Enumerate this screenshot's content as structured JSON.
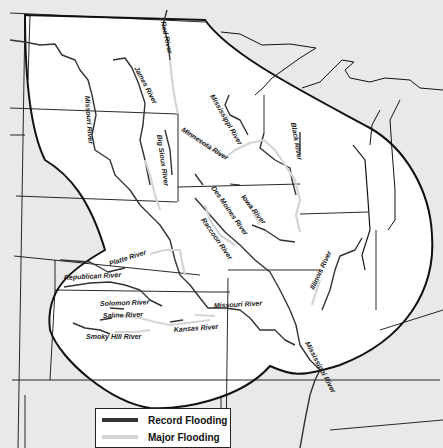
{
  "map": {
    "colors": {
      "outside_region": "#e9e9e9",
      "flood_region": "#ffffff",
      "border": "#111111",
      "record_flooding": "#333333",
      "major_flooding": "#d4d4d4"
    },
    "river_labels": [
      {
        "name": "Red River",
        "x": 161,
        "y": 22,
        "rotate": 78
      },
      {
        "name": "James River",
        "x": 134,
        "y": 68,
        "rotate": 62
      },
      {
        "name": "Missouri River",
        "x": 85,
        "y": 96,
        "rotate": 86
      },
      {
        "name": "Mississippi River",
        "x": 210,
        "y": 96,
        "rotate": 60
      },
      {
        "name": "Black River",
        "x": 291,
        "y": 123,
        "rotate": 80
      },
      {
        "name": "Minnesota River",
        "x": 181,
        "y": 131,
        "rotate": 33
      },
      {
        "name": "Big Sioux River",
        "x": 157,
        "y": 135,
        "rotate": 82
      },
      {
        "name": "Des Moines River",
        "x": 211,
        "y": 188,
        "rotate": 55
      },
      {
        "name": "Iowa River",
        "x": 241,
        "y": 197,
        "rotate": 52
      },
      {
        "name": "Raccoon River",
        "x": 201,
        "y": 220,
        "rotate": 55
      },
      {
        "name": "Platte River",
        "x": 110,
        "y": 266,
        "rotate": -18
      },
      {
        "name": "Republican River",
        "x": 64,
        "y": 280,
        "rotate": -3
      },
      {
        "name": "Solomon River",
        "x": 100,
        "y": 306,
        "rotate": -2
      },
      {
        "name": "Saline River",
        "x": 103,
        "y": 318,
        "rotate": -2
      },
      {
        "name": "Smoky Hill River",
        "x": 86,
        "y": 339,
        "rotate": 0
      },
      {
        "name": "Kansas River",
        "x": 174,
        "y": 332,
        "rotate": -4
      },
      {
        "name": "Missouri River",
        "x": 214,
        "y": 308,
        "rotate": -3
      },
      {
        "name": "Illinois River",
        "x": 314,
        "y": 290,
        "rotate": -65
      },
      {
        "name": "Mississippi River",
        "x": 305,
        "y": 343,
        "rotate": 62
      }
    ]
  },
  "legend": {
    "items": [
      {
        "label": "Record Flooding",
        "color": "#333333"
      },
      {
        "label": "Major Flooding",
        "color": "#d4d4d4"
      }
    ]
  }
}
